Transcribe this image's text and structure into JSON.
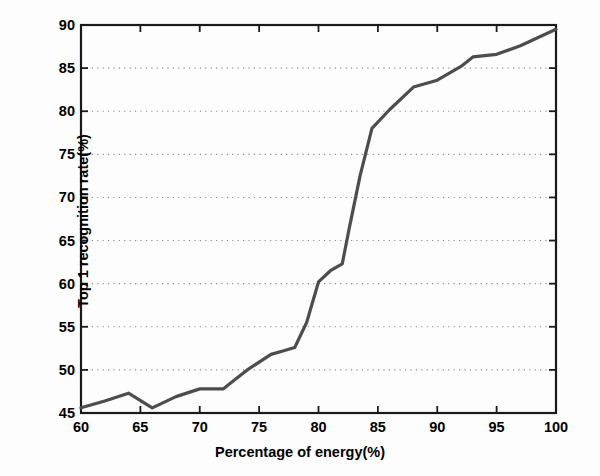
{
  "chart_data": {
    "type": "line",
    "title": "",
    "xlabel": "Percentage of energy(%)",
    "ylabel": "Top 1 recognition rate(%)",
    "xlim": [
      60,
      100
    ],
    "ylim": [
      45,
      90
    ],
    "xticks": [
      60,
      65,
      70,
      75,
      80,
      85,
      90,
      95,
      100
    ],
    "yticks": [
      45,
      50,
      55,
      60,
      65,
      70,
      75,
      80,
      85,
      90
    ],
    "grid": "horizontal-dotted",
    "legend": "none",
    "line_color": "#4d4d4d",
    "line_width": 3,
    "x": [
      60,
      62,
      64,
      66,
      68,
      70,
      72,
      73,
      74,
      76,
      77,
      78,
      79,
      80,
      81,
      82,
      82.6,
      83.5,
      84.5,
      86,
      88,
      90,
      92,
      93,
      95,
      97,
      100
    ],
    "values": [
      45.6,
      46.4,
      47.3,
      45.6,
      46.9,
      47.8,
      47.8,
      48.9,
      50.0,
      51.8,
      52.2,
      52.6,
      55.5,
      60.2,
      61.5,
      62.3,
      66.5,
      72.5,
      78.0,
      80.2,
      82.8,
      83.6,
      85.2,
      86.3,
      86.6,
      87.6,
      89.5
    ],
    "series": [
      {
        "name": "Top 1 recognition rate",
        "values": [
          45.6,
          46.4,
          47.3,
          45.6,
          46.9,
          47.8,
          47.8,
          48.9,
          50.0,
          51.8,
          52.2,
          52.6,
          55.5,
          60.2,
          61.5,
          62.3,
          66.5,
          72.5,
          78.0,
          80.2,
          82.8,
          83.6,
          85.2,
          86.3,
          86.6,
          87.6,
          89.5
        ]
      }
    ]
  },
  "axes": {
    "x_title": "Percentage of energy(%)",
    "y_title": "Top 1 recognition rate(%)",
    "x_tick_labels": [
      "60",
      "65",
      "70",
      "75",
      "80",
      "85",
      "90",
      "95",
      "100"
    ],
    "y_tick_labels": [
      "45",
      "50",
      "55",
      "60",
      "65",
      "70",
      "75",
      "80",
      "85",
      "90"
    ]
  },
  "colors": {
    "line": "#4d4d4d",
    "axis": "#1a1a1a",
    "grid": "#8c8c8c",
    "background": "#fdfdfd"
  }
}
